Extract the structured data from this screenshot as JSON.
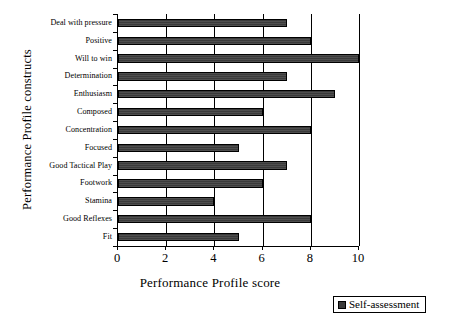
{
  "chart_data": {
    "type": "bar",
    "orientation": "horizontal",
    "title": "",
    "xlabel": "Performance Profile score",
    "ylabel": "Performance Profile constructs",
    "xlim": [
      0,
      10
    ],
    "xticks": [
      0,
      2,
      4,
      6,
      8,
      10
    ],
    "xtick_labels": [
      "0",
      "2",
      "4",
      "6",
      "8",
      "10"
    ],
    "grid": "vertical",
    "legend_position": "bottom-right",
    "bar_color": "#3a3a3a",
    "bar_edge_color": "#000000",
    "categories": [
      "Deal with pressure",
      "Positive",
      "Will to win",
      "Determination",
      "Enthusiasm",
      "Composed",
      "Concentration",
      "Focused",
      "Good Tactical Play",
      "Footwork",
      "Stamina",
      "Good Reflexes",
      "Fit"
    ],
    "series": [
      {
        "name": "Self-assessment",
        "color": "#3a3a3a",
        "values": [
          7,
          8,
          10,
          7,
          9,
          6,
          8,
          5,
          7,
          6,
          4,
          8,
          5
        ]
      }
    ]
  },
  "legend": {
    "entries": [
      {
        "label": "Self-assessment",
        "color": "#3a3a3a"
      }
    ]
  }
}
